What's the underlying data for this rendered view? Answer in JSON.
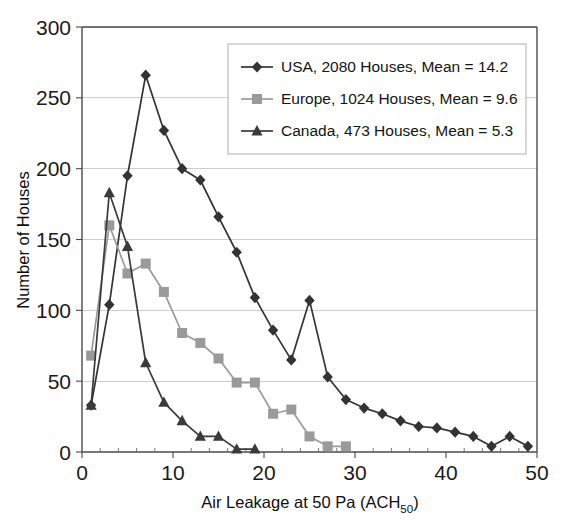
{
  "chart_data": {
    "type": "line",
    "title": "",
    "xlabel": "Air Leakage at 50 Pa (ACH50)",
    "xlabel_main": "Air Leakage at 50 Pa (ACH",
    "xlabel_sub": "50",
    "xlabel_tail": ")",
    "ylabel": "Number of Houses",
    "xlim": [
      0,
      50
    ],
    "ylim": [
      0,
      300
    ],
    "xticks": [
      0,
      10,
      20,
      30,
      40,
      50
    ],
    "yticks": [
      0,
      50,
      100,
      150,
      200,
      250,
      300
    ],
    "xtick_labels": [
      "0",
      "10",
      "20",
      "30",
      "40",
      "50"
    ],
    "ytick_labels": [
      "0",
      "50",
      "100",
      "150",
      "200",
      "250",
      "300"
    ],
    "x_minor_step": 2,
    "grid": "horizontal",
    "legend_position": "top-right",
    "series": [
      {
        "name": "USA, 2080 Houses, Mean = 14.2",
        "short_name": "USA",
        "houses": 2080,
        "mean": 14.2,
        "marker": "diamond",
        "color": "#333333",
        "x": [
          1,
          3,
          5,
          7,
          9,
          11,
          13,
          15,
          17,
          19,
          21,
          23,
          25,
          27,
          29,
          31,
          33,
          35,
          37,
          39,
          41,
          43,
          45,
          47,
          49
        ],
        "values": [
          33,
          104,
          195,
          266,
          227,
          200,
          192,
          166,
          141,
          109,
          86,
          65,
          107,
          53,
          37,
          31,
          27,
          22,
          18,
          17,
          14,
          11,
          4,
          11,
          4
        ]
      },
      {
        "name": "Europe, 1024 Houses, Mean = 9.6",
        "short_name": "Europe",
        "houses": 1024,
        "mean": 9.6,
        "marker": "square",
        "color": "#9a9a9a",
        "x": [
          1,
          3,
          5,
          7,
          9,
          11,
          13,
          15,
          17,
          19,
          21,
          23,
          25,
          27,
          29
        ],
        "values": [
          68,
          160,
          126,
          133,
          113,
          84,
          77,
          66,
          49,
          49,
          27,
          30,
          11,
          4,
          4
        ]
      },
      {
        "name": "Canada, 473 Houses, Mean = 5.3",
        "short_name": "Canada",
        "houses": 473,
        "mean": 5.3,
        "marker": "triangle",
        "color": "#3a3a3a",
        "x": [
          1,
          3,
          5,
          7,
          9,
          11,
          13,
          15,
          17,
          19
        ],
        "values": [
          33,
          183,
          145,
          63,
          35,
          22,
          11,
          11,
          2,
          2
        ]
      }
    ]
  },
  "legend": {
    "entries": [
      {
        "label": "USA, 2080 Houses, Mean = 14.2"
      },
      {
        "label": "Europe, 1024 Houses, Mean = 9.6"
      },
      {
        "label": "Canada, 473 Houses, Mean = 5.3"
      }
    ]
  }
}
